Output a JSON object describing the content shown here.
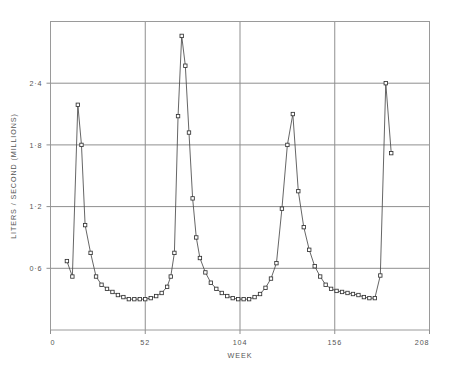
{
  "chart_data": {
    "type": "line",
    "title": "",
    "xlabel": "WEEK",
    "ylabel": "LITERS / SECOND (MILLIONS)",
    "xlim": [
      0,
      208
    ],
    "ylim": [
      0,
      3.0
    ],
    "xticks": [
      0,
      52,
      104,
      156,
      208
    ],
    "xtick_labels": [
      "0",
      "52",
      "104",
      "156",
      "208"
    ],
    "yticks": [
      0.6,
      1.2,
      1.8,
      2.4
    ],
    "ytick_labels": [
      "0·6",
      "1·2",
      "1·8",
      "2·4"
    ],
    "grid": true,
    "grid_axis": "both",
    "legend": false,
    "marker": "open-square",
    "series": [
      {
        "name": "flow",
        "x": [
          9,
          12,
          15,
          17,
          19,
          22,
          25,
          28,
          31,
          34,
          37,
          40,
          43,
          46,
          49,
          52,
          55,
          58,
          61,
          64,
          66,
          68,
          70,
          72,
          74,
          76,
          78,
          80,
          82,
          85,
          88,
          91,
          94,
          97,
          100,
          103,
          106,
          109,
          112,
          115,
          118,
          121,
          124,
          127,
          130,
          133,
          136,
          139,
          142,
          145,
          148,
          151,
          154,
          157,
          160,
          163,
          166,
          169,
          172,
          175,
          178,
          181,
          184,
          187
        ],
        "y": [
          0.67,
          0.52,
          2.19,
          1.8,
          1.02,
          0.75,
          0.52,
          0.44,
          0.4,
          0.37,
          0.34,
          0.32,
          0.3,
          0.3,
          0.3,
          0.3,
          0.31,
          0.33,
          0.36,
          0.42,
          0.52,
          0.75,
          2.08,
          2.86,
          2.57,
          1.92,
          1.28,
          0.9,
          0.7,
          0.56,
          0.46,
          0.4,
          0.36,
          0.33,
          0.31,
          0.3,
          0.3,
          0.3,
          0.32,
          0.35,
          0.41,
          0.5,
          0.65,
          1.18,
          1.8,
          2.1,
          1.35,
          1.0,
          0.78,
          0.62,
          0.52,
          0.44,
          0.4,
          0.38,
          0.37,
          0.36,
          0.35,
          0.34,
          0.32,
          0.31,
          0.31,
          0.53,
          2.4,
          1.72
        ]
      }
    ]
  },
  "axes": {
    "ylabel_text": "LITERS / SECOND (MILLIONS)",
    "xlabel_text": "WEEK"
  },
  "colors": {
    "line": "#4a4a4a",
    "marker_stroke": "#333333",
    "marker_fill": "#ffffff",
    "grid": "#8f8f8f",
    "frame": "#9a9a9a",
    "text": "#555555",
    "background": "#ffffff"
  }
}
